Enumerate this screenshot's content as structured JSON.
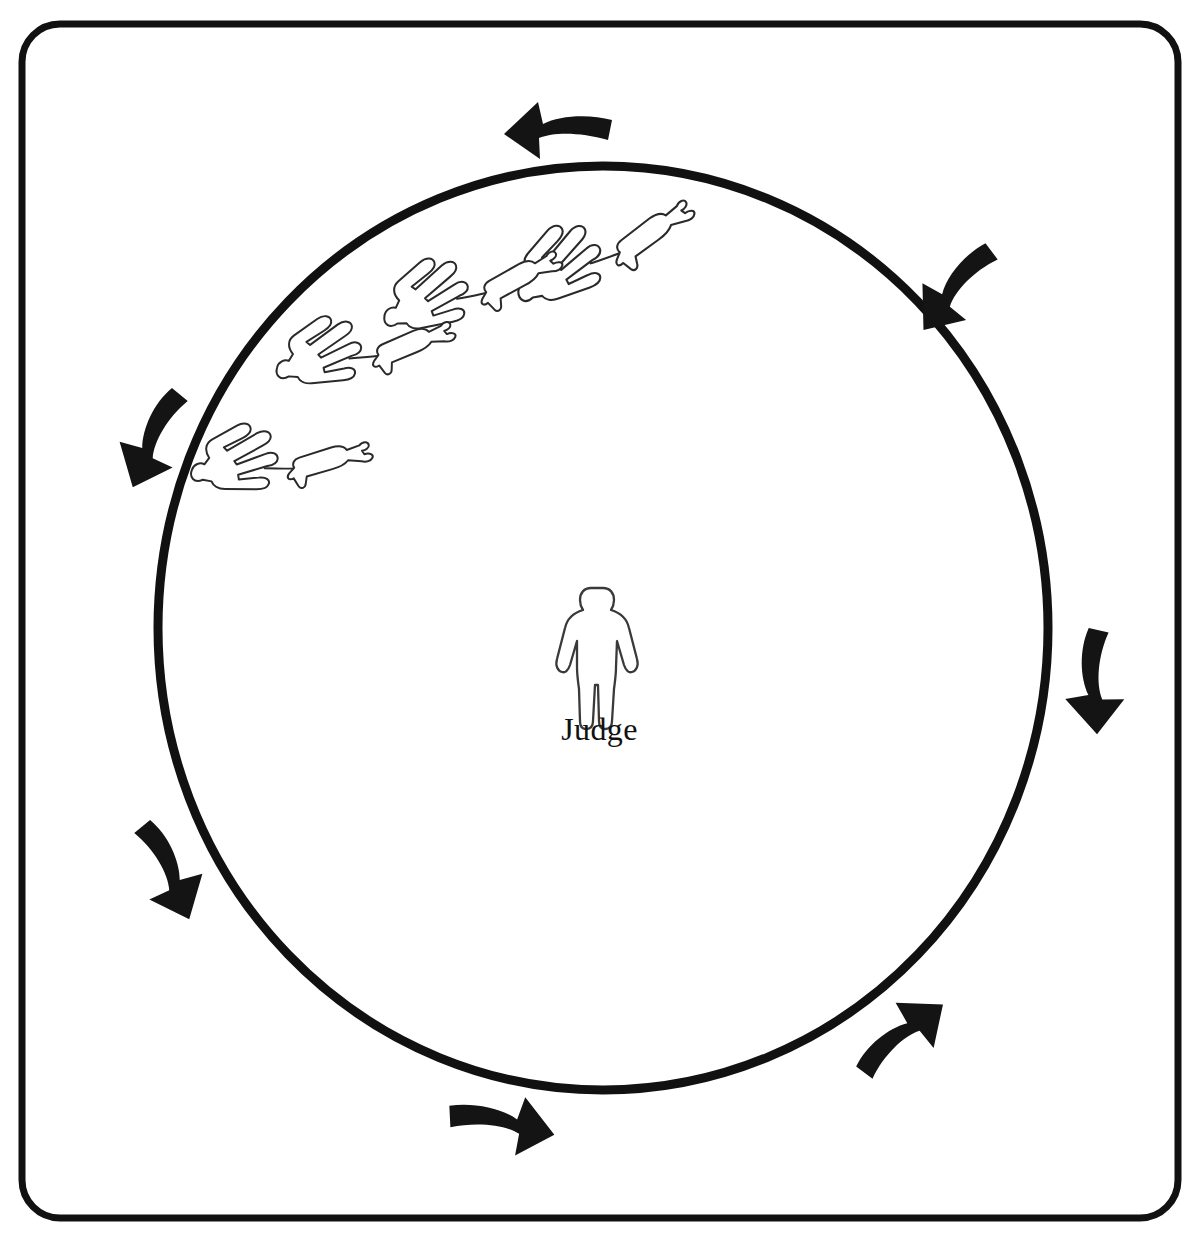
{
  "diagram": {
    "type": "ring-procedure-diagram",
    "background_color": "#ffffff",
    "ink_color": "#111111",
    "frame": {
      "shape": "rounded-rectangle",
      "x": 22,
      "y": 24,
      "width": 1156,
      "height": 1194,
      "corner_radius": 38,
      "stroke_width": 7,
      "color": "#111111"
    },
    "ring": {
      "shape": "circle",
      "center_x": 603,
      "center_y": 628,
      "radius_x": 445,
      "radius_y": 462,
      "stroke_width": 9,
      "color": "#111111",
      "direction": "counter-clockwise"
    },
    "judge": {
      "label": "Judge",
      "icon": "standing-person-icon",
      "center_x": 603,
      "center_y": 645,
      "caption_top": 713,
      "caption_font_size": 32,
      "color": "#ffffff",
      "outline_color": "#3a3a3a"
    },
    "entrants": {
      "count": 4,
      "icon": "handler-with-dog-icon",
      "description": "Handler figure leading a dog, seen from above, gaiting around the ring",
      "pairs": [
        {
          "id": "pair-1",
          "position": "inner-upper-right",
          "x": 585,
          "y": 238,
          "angle": -28,
          "scale": 1.0
        },
        {
          "id": "pair-2",
          "position": "inner-upper-middle",
          "x": 455,
          "y": 274,
          "angle": -20,
          "scale": 0.96
        },
        {
          "id": "pair-3",
          "position": "inner-upper-left",
          "x": 350,
          "y": 334,
          "angle": -14,
          "scale": 0.94
        },
        {
          "id": "pair-4",
          "position": "inner-left",
          "x": 268,
          "y": 444,
          "angle": -8,
          "scale": 0.94
        }
      ]
    },
    "arrows": {
      "count": 8,
      "color": "#141414",
      "style": "hand-drawn-curved-arrow",
      "meaning": "direction of travel around the ring",
      "items": [
        {
          "id": "arrow-top",
          "position": "top",
          "points": "left",
          "x": 560,
          "y": 126,
          "angle": 186
        },
        {
          "id": "arrow-upper-right",
          "position": "upper-right",
          "points": "up-left",
          "x": 955,
          "y": 283,
          "angle": 232
        },
        {
          "id": "arrow-right",
          "position": "right",
          "points": "up",
          "x": 1091,
          "y": 678,
          "angle": 272
        },
        {
          "id": "arrow-lower-right",
          "position": "lower-right",
          "points": "up-right",
          "x": 896,
          "y": 1036,
          "angle": 318
        },
        {
          "id": "arrow-bottom",
          "position": "bottom",
          "points": "right",
          "x": 500,
          "y": 1119,
          "angle": 8
        },
        {
          "id": "arrow-lower-left",
          "position": "lower-left",
          "points": "down-right",
          "x": 170,
          "y": 866,
          "angle": 58
        },
        {
          "id": "arrow-upper-left",
          "position": "upper-left",
          "points": "down-left",
          "x": 152,
          "y": 434,
          "angle": 116
        }
      ]
    }
  }
}
